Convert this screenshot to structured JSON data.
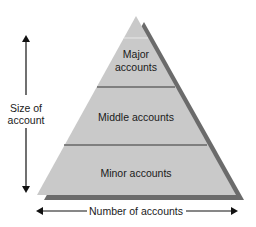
{
  "diagram": {
    "type": "pyramid",
    "tiers": [
      {
        "label_line1": "Major",
        "label_line2": "accounts"
      },
      {
        "label": "Middle accounts"
      },
      {
        "label": "Minor accounts"
      }
    ],
    "y_axis": {
      "label_line1": "Size of",
      "label_line2": "account"
    },
    "x_axis": {
      "label": "Number of accounts"
    },
    "colors": {
      "fill": "#c9c9c9",
      "shadow": "#6b6b6b",
      "divider": "#666666",
      "text": "#1a1a1a",
      "arrow": "#111111"
    }
  }
}
